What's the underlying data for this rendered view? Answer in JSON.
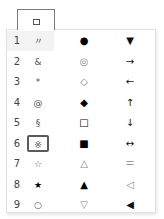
{
  "trigger": {
    "icon": "small-square-icon",
    "glyph": "▫"
  },
  "dropdown": {
    "hovered_row": 1,
    "focused_row": 6,
    "rows": [
      {
        "num": "1",
        "c1": "〃",
        "c2": "●",
        "c3": "▼"
      },
      {
        "num": "2",
        "c1": "&",
        "c2": "◎",
        "c3": "→"
      },
      {
        "num": "3",
        "c1": "*",
        "c2": "◇",
        "c3": "←"
      },
      {
        "num": "4",
        "c1": "@",
        "c2": "◆",
        "c3": "↑"
      },
      {
        "num": "5",
        "c1": "§",
        "c2": "□",
        "c3": "↓"
      },
      {
        "num": "6",
        "c1": "※",
        "c2": "■",
        "c3": "↔"
      },
      {
        "num": "7",
        "c1": "☆",
        "c2": "△",
        "c3": "＝"
      },
      {
        "num": "8",
        "c1": "★",
        "c2": "▲",
        "c3": "◁"
      },
      {
        "num": "9",
        "c1": "○",
        "c2": "▽",
        "c3": "◀"
      }
    ]
  }
}
